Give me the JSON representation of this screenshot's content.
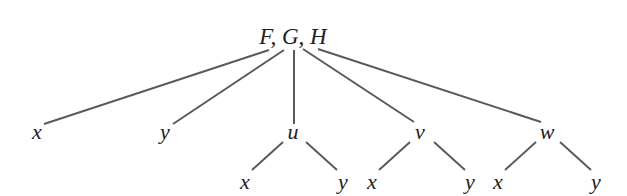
{
  "diagram": {
    "type": "tree",
    "colors": {
      "edge": "#5a5a5a",
      "text": "#222222",
      "background": "#ffffff"
    },
    "root": {
      "label": "F, G, H",
      "x": 293,
      "y": 44
    },
    "level1": [
      {
        "id": "n1",
        "label": "x",
        "x": 37,
        "y": 139
      },
      {
        "id": "n2",
        "label": "y",
        "x": 165,
        "y": 139
      },
      {
        "id": "n3",
        "label": "u",
        "x": 293,
        "y": 139
      },
      {
        "id": "n4",
        "label": "v",
        "x": 420,
        "y": 139
      },
      {
        "id": "n5",
        "label": "w",
        "x": 547,
        "y": 139
      }
    ],
    "level2": [
      {
        "id": "n3a",
        "parent": "n3",
        "label": "x",
        "x": 245,
        "y": 189
      },
      {
        "id": "n3b",
        "parent": "n3",
        "label": "y",
        "x": 343,
        "y": 189
      },
      {
        "id": "n4a",
        "parent": "n4",
        "label": "x",
        "x": 372,
        "y": 189
      },
      {
        "id": "n4b",
        "parent": "n4",
        "label": "y",
        "x": 470,
        "y": 189
      },
      {
        "id": "n5a",
        "parent": "n5",
        "label": "x",
        "x": 498,
        "y": 189
      },
      {
        "id": "n5b",
        "parent": "n5",
        "label": "y",
        "x": 596,
        "y": 189
      }
    ],
    "edges": [
      {
        "from": "root",
        "to": "n1",
        "x1": 269,
        "y1": 50,
        "x2": 44,
        "y2": 124
      },
      {
        "from": "root",
        "to": "n2",
        "x1": 284,
        "y1": 50,
        "x2": 173,
        "y2": 124
      },
      {
        "from": "root",
        "to": "n3",
        "x1": 294,
        "y1": 50,
        "x2": 294,
        "y2": 124
      },
      {
        "from": "root",
        "to": "n4",
        "x1": 303,
        "y1": 49,
        "x2": 414,
        "y2": 122
      },
      {
        "from": "root",
        "to": "n5",
        "x1": 318,
        "y1": 49,
        "x2": 541,
        "y2": 122
      },
      {
        "from": "n3",
        "to": "n3a",
        "x1": 283,
        "y1": 142,
        "x2": 252,
        "y2": 170
      },
      {
        "from": "n3",
        "to": "n3b",
        "x1": 306,
        "y1": 142,
        "x2": 337,
        "y2": 170
      },
      {
        "from": "n4",
        "to": "n4a",
        "x1": 410,
        "y1": 142,
        "x2": 379,
        "y2": 170
      },
      {
        "from": "n4",
        "to": "n4b",
        "x1": 434,
        "y1": 142,
        "x2": 465,
        "y2": 170
      },
      {
        "from": "n5",
        "to": "n5a",
        "x1": 536,
        "y1": 142,
        "x2": 505,
        "y2": 170
      },
      {
        "from": "n5",
        "to": "n5b",
        "x1": 560,
        "y1": 142,
        "x2": 591,
        "y2": 170
      }
    ]
  }
}
